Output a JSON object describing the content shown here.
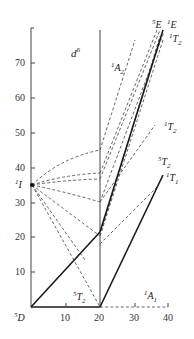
{
  "diagram": {
    "title": "d6",
    "title_base": "d",
    "title_sup": "6",
    "type": "Tanabe-Sugano style energy level diagram (d6)",
    "y_axis": {
      "ticks": [
        "10",
        "20",
        "30",
        "40",
        "50",
        "60",
        "70"
      ]
    },
    "x_axis": {
      "ticks": [
        "10",
        "20",
        "30",
        "40"
      ],
      "origin_label": {
        "sup": "5",
        "base": "D"
      }
    },
    "terms": {
      "left_1I": {
        "sup": "1",
        "base": "I"
      },
      "A2": {
        "sup": "1",
        "base": "A",
        "sub": "2"
      },
      "E5": {
        "sup": "5",
        "base": "E"
      },
      "E1": {
        "sup": "1",
        "base": "E"
      },
      "T2_1_top": {
        "sup": "1",
        "base": "T",
        "sub": "2"
      },
      "T2_1_mid": {
        "sup": "1",
        "base": "T",
        "sub": "2"
      },
      "T2_5_right": {
        "sup": "5",
        "base": "T",
        "sub": "2"
      },
      "T1_1": {
        "sup": "1",
        "base": "T",
        "sub": "1"
      },
      "T2_5_low": {
        "sup": "5",
        "base": "T",
        "sub": "2"
      },
      "A1": {
        "sup": "1",
        "base": "A",
        "sub": "1"
      }
    },
    "colors": {
      "line": "#1a1a1a",
      "dashed": "#555555",
      "axis": "#444444"
    }
  }
}
